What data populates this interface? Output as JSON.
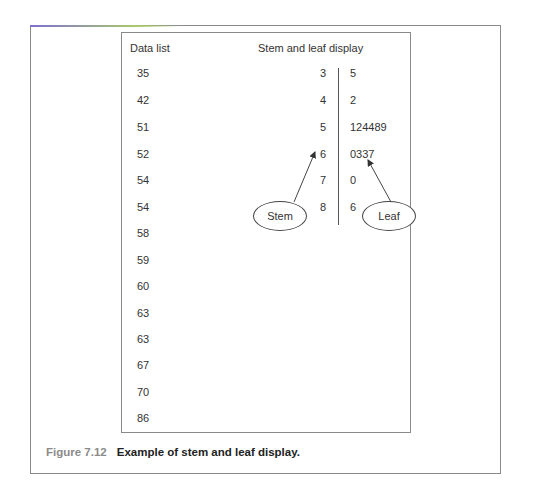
{
  "figure": {
    "label": "Figure 7.12",
    "caption": "Example of stem and leaf display.",
    "accent_color": "#8a8a8a"
  },
  "data_list": {
    "header": "Data list",
    "values": [
      "35",
      "42",
      "51",
      "52",
      "54",
      "54",
      "58",
      "59",
      "60",
      "63",
      "63",
      "67",
      "70",
      "86"
    ]
  },
  "stem_leaf": {
    "header": "Stem and leaf display",
    "rows": [
      {
        "stem": "3",
        "leaf": "5"
      },
      {
        "stem": "4",
        "leaf": "2"
      },
      {
        "stem": "5",
        "leaf": "124489"
      },
      {
        "stem": "6",
        "leaf": "0337"
      },
      {
        "stem": "7",
        "leaf": "0"
      },
      {
        "stem": "8",
        "leaf": "6"
      }
    ],
    "annotations": {
      "stem_label": "Stem",
      "leaf_label": "Leaf"
    }
  }
}
